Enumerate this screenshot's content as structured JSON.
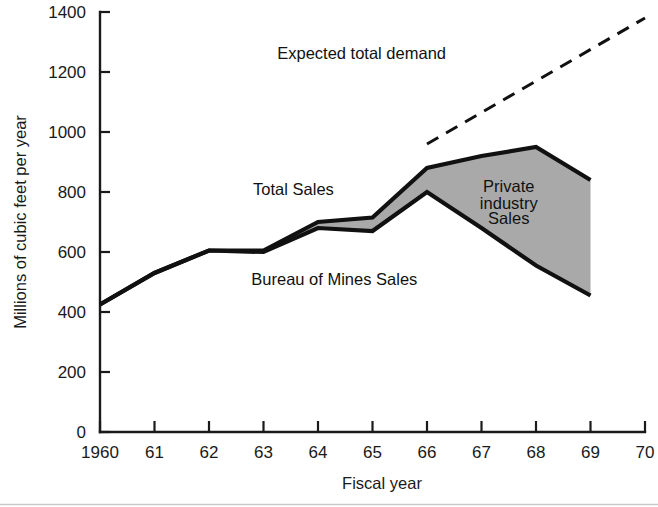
{
  "chart_data": {
    "type": "area",
    "title": "",
    "xlabel": "Fiscal year",
    "ylabel": "Millions of cubic feet per year",
    "x": [
      1960,
      1961,
      1962,
      1963,
      1964,
      1965,
      1966,
      1967,
      1968,
      1969
    ],
    "xtick_labels": [
      "1960",
      "61",
      "62",
      "63",
      "64",
      "65",
      "66",
      "67",
      "68",
      "69",
      "70"
    ],
    "ytick_labels": [
      "0",
      "200",
      "400",
      "600",
      "800",
      "1000",
      "1200",
      "1400"
    ],
    "ytick_values": [
      0,
      200,
      400,
      600,
      800,
      1000,
      1200,
      1400
    ],
    "xlim": [
      1960,
      1970
    ],
    "ylim": [
      0,
      1400
    ],
    "grid": false,
    "legend_position": "inline-annotations",
    "series": [
      {
        "name": "Total Sales",
        "values": [
          425,
          530,
          605,
          605,
          700,
          715,
          880,
          920,
          950,
          840
        ]
      },
      {
        "name": "Bureau of Mines Sales",
        "values": [
          425,
          530,
          605,
          600,
          680,
          670,
          800,
          680,
          555,
          455
        ]
      },
      {
        "name": "Expected total demand",
        "x": [
          1966,
          1970
        ],
        "values": [
          960,
          1380
        ],
        "style": "dashed"
      }
    ],
    "shaded_band": {
      "label": "Private industry Sales",
      "between": [
        "Total Sales",
        "Bureau of Mines Sales"
      ],
      "color": "#a9a9a9"
    },
    "annotations": [
      {
        "id": "total-sales",
        "text": "Total Sales",
        "x": 1963.55,
        "y": 790
      },
      {
        "id": "bureau-of-mines-sales",
        "text": "Bureau of Mines Sales",
        "x": 1964.3,
        "y": 490
      },
      {
        "id": "private-industry-sales-1",
        "text": "Private",
        "x": 1967.5,
        "y": 800
      },
      {
        "id": "private-industry-sales-2",
        "text": "industry",
        "x": 1967.5,
        "y": 745
      },
      {
        "id": "private-industry-sales-3",
        "text": "Sales",
        "x": 1967.5,
        "y": 692
      },
      {
        "id": "expected-total-demand",
        "text": "Expected total demand",
        "x": 1964.8,
        "y": 1245
      }
    ],
    "colors": {
      "band_fill": "#a9a9a9",
      "line": "#111111",
      "axis": "#1a1a1a",
      "background": "#ffffff"
    }
  }
}
